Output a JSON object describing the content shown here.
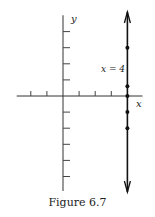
{
  "figure": {
    "caption": "Figure 6.7",
    "x_axis_label": "x",
    "y_axis_label": "y",
    "line_label": "x = 4",
    "line_x": 4,
    "x_ticks": [
      -2,
      -1,
      1,
      2,
      3
    ],
    "y_ticks": [
      -5,
      -4,
      -3,
      -2,
      -1,
      1,
      2,
      3,
      4
    ],
    "points": [
      {
        "x": 4,
        "y": 3
      },
      {
        "x": 4,
        "y": 0.6
      },
      {
        "x": 4,
        "y": 0
      },
      {
        "x": 4,
        "y": -1
      },
      {
        "x": 4,
        "y": -2
      }
    ],
    "x_range": [
      -3,
      5
    ],
    "y_range": [
      -5.9,
      5.2
    ],
    "colors": {
      "ink": "#111111",
      "axis": "#333333"
    }
  }
}
